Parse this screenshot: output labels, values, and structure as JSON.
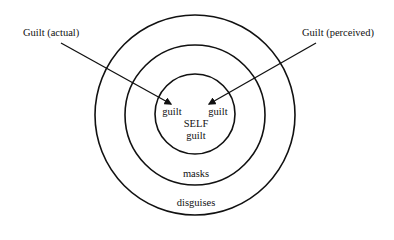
{
  "diagram": {
    "labels": {
      "guilt_actual": "Guilt (actual)",
      "guilt_perceived": "Guilt (perceived)",
      "inner_guilt_left": "guilt",
      "inner_guilt_right": "guilt",
      "self": "SELF",
      "inner_guilt_bottom": "guilt",
      "masks": "masks",
      "disguises": "disguises"
    },
    "rings": [
      {
        "name": "self",
        "radius": 40
      },
      {
        "name": "masks",
        "radius": 70
      },
      {
        "name": "disguises",
        "radius": 100
      }
    ],
    "center": {
      "x": 195,
      "y": 115
    },
    "stroke_color": "#111111"
  }
}
